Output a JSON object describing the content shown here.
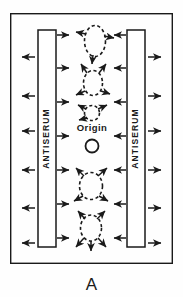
{
  "figure": {
    "caption": "A",
    "panel_label": "A",
    "background_color": "#fefefe",
    "ink_color": "#1a1a1a",
    "border": {
      "name": "outer-frame",
      "x": 10,
      "y": 13,
      "width": 163,
      "height": 251,
      "stroke_width": 1.4
    },
    "origin": {
      "label": "Origin",
      "label_x": 92,
      "label_y": 128,
      "font_size": 9,
      "well_cx": 92,
      "well_cy": 144,
      "well_r": 6.5,
      "well_stroke_width": 1.8
    },
    "troughs": [
      {
        "name": "antiserum-trough-left",
        "label": "ANTISERUM",
        "x": 38,
        "y": 30,
        "width": 18,
        "height": 217,
        "stroke_width": 1.5,
        "text_rotation": -90,
        "font_size": 8.5,
        "letter_spacing": 1.1,
        "outward_arrow_count": 6,
        "inward_arrow_count": 7
      },
      {
        "name": "antiserum-trough-right",
        "label": "ANTISERUM",
        "x": 127,
        "y": 30,
        "width": 18,
        "height": 217,
        "stroke_width": 1.5,
        "text_rotation": -90,
        "font_size": 8.5,
        "letter_spacing": 1.1,
        "outward_arrow_count": 6,
        "inward_arrow_count": 7
      }
    ],
    "precipitin_arcs": [
      {
        "name": "precipitin-arc-1",
        "description": "dashed ellipse above origin, arrows left, right and down",
        "cx": 95,
        "cy": 41,
        "rx": 11,
        "ry": 16,
        "arrows": [
          "left",
          "right",
          "down"
        ]
      },
      {
        "name": "precipitin-arc-2",
        "description": "dashed ellipse with four diagonal arrows",
        "cx": 93,
        "cy": 83,
        "rx": 10,
        "ry": 13,
        "arrows": [
          "up-left",
          "up-right",
          "down-left",
          "down-right"
        ]
      },
      {
        "name": "precipitin-arc-3",
        "description": "small dashed arc near origin with upward diagonal arrows",
        "cx": 92,
        "cy": 113,
        "rx": 8,
        "ry": 8,
        "arrows": [
          "up-left",
          "up-right",
          "down-left"
        ]
      },
      {
        "name": "precipitin-arc-4",
        "description": "dashed ellipse below origin with four diagonal arrows",
        "cx": 91,
        "cy": 186,
        "rx": 12,
        "ry": 14,
        "arrows": [
          "up-left",
          "up-right",
          "down-left",
          "down-right"
        ]
      },
      {
        "name": "precipitin-arc-5",
        "description": "dashed lower arc with downward fanning arrows",
        "cx": 91,
        "cy": 228,
        "rx": 11,
        "ry": 13,
        "arrows": [
          "up-left",
          "up-right",
          "down-left",
          "down",
          "down-right"
        ]
      }
    ],
    "left_outward_arrow_ys": [
      57,
      96,
      131,
      170,
      208,
      243
    ],
    "left_inward_arrow_ys": [
      35,
      68,
      102,
      136,
      170,
      204,
      238
    ],
    "right_outward_arrow_ys": [
      57,
      96,
      131,
      170,
      208,
      243
    ],
    "right_inward_arrow_ys": [
      35,
      68,
      102,
      136,
      170,
      204,
      238
    ]
  }
}
